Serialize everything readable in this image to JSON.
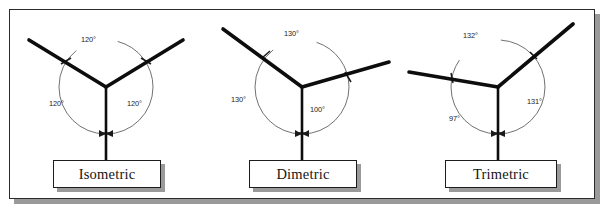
{
  "figure": {
    "panel_count": 3,
    "frame_border_color": "#2b2b2b",
    "shadow_color": "#9a9a9a",
    "axis_color": "#0d0d0d",
    "arc_color": "#4a4a4a",
    "background": "#ffffff"
  },
  "panels": [
    {
      "id": "isometric",
      "label": "Isometric",
      "angles": [
        {
          "id": "top",
          "value": "120°"
        },
        {
          "id": "lower-left",
          "value": "120°"
        },
        {
          "id": "lower-right",
          "value": "120°"
        }
      ],
      "axes": [
        {
          "id": "left-axis",
          "direction_deg": 150
        },
        {
          "id": "right-axis",
          "direction_deg": 30
        },
        {
          "id": "vertical-axis",
          "direction_deg": 270
        }
      ]
    },
    {
      "id": "dimetric",
      "label": "Dimetric",
      "angles": [
        {
          "id": "top",
          "value": "130°"
        },
        {
          "id": "lower-left",
          "value": "130°"
        },
        {
          "id": "lower-right",
          "value": "100°"
        }
      ],
      "axes": [
        {
          "id": "left-axis",
          "direction_deg": 140
        },
        {
          "id": "right-axis",
          "direction_deg": 15
        },
        {
          "id": "vertical-axis",
          "direction_deg": 270
        }
      ]
    },
    {
      "id": "trimetric",
      "label": "Trimetric",
      "angles": [
        {
          "id": "top",
          "value": "132°"
        },
        {
          "id": "lower-left",
          "value": "97°"
        },
        {
          "id": "lower-right",
          "value": "131°"
        }
      ],
      "axes": [
        {
          "id": "left-axis",
          "direction_deg": 170
        },
        {
          "id": "right-axis",
          "direction_deg": 40
        },
        {
          "id": "vertical-axis",
          "direction_deg": 270
        }
      ]
    }
  ]
}
